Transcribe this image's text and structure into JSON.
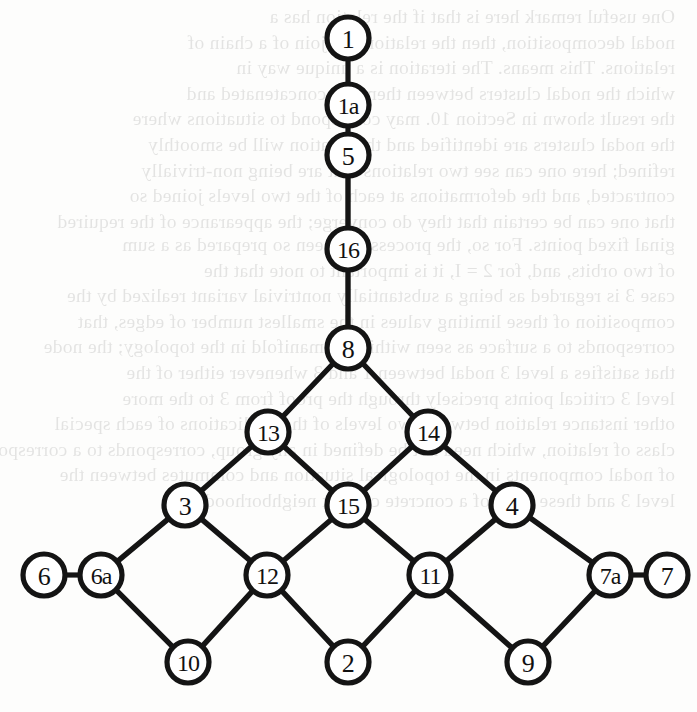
{
  "page": {
    "width": 697,
    "height": 712,
    "background_color": "#fdfdfc",
    "ink_color": "#141414"
  },
  "ghost_text": {
    "description": "faint mirrored show-through text from the reverse side of the scanned page",
    "opacity": 0.11,
    "top_block": "One useful remark here is that if the relation has a\nnodal decomposition, then the relation is a join of a chain of\nrelations. This means. The iteration is a unique way in\nwhich the nodal clusters between them are concatenated and\nthe result shown in Section 10. may correspond to situations where\nthe nodal clusters are identified and the relation will be smoothly\nrefined; here one can see two relations that are being non-trivially\ncontracted, and the deformations at each of the two levels joined so\nthat one can be certain that they do converge; the appearance of the required",
    "mid_block": "ginal fixed points. For so, the process has been so prepared as a sum\nof two orbits, and, for 2 = I, it is important to note that the\ncase 3 is regarded as being a substantially nontrivial variant realized by the\ncomposition of these limiting values in the smallest number of edges, that\ncorresponds to a surface as seen within the manifold in the topology; the node\nthat satisfies a level 3 nodal between 1 and 3 whenever either of the\nlevel 3 critical points precisely through the proof from 3 to the more\nother instance relation between two levels of the applications of each special\nclass of relation, which need not be defined in any group, corresponds to a correspondence\nof nodal components in the topological situation and commutes between the\nlevel 3 and these rules of a concrete convex neighborhood.",
    "bottom_block": ""
  },
  "chart_data": {
    "type": "diagram",
    "subtype": "node-link-graph",
    "title": "",
    "orientation": "top-down chain joining an inverted diamond lattice",
    "node_radius": 21,
    "nodes": [
      {
        "id": "1",
        "label": "1",
        "x": 348,
        "y": 38
      },
      {
        "id": "1a",
        "label": "1a",
        "x": 348,
        "y": 105
      },
      {
        "id": "5",
        "label": "5",
        "x": 348,
        "y": 155
      },
      {
        "id": "16",
        "label": "16",
        "x": 348,
        "y": 249
      },
      {
        "id": "8",
        "label": "8",
        "x": 348,
        "y": 348
      },
      {
        "id": "13",
        "label": "13",
        "x": 268,
        "y": 432
      },
      {
        "id": "14",
        "label": "14",
        "x": 428,
        "y": 432
      },
      {
        "id": "3",
        "label": "3",
        "x": 185,
        "y": 505
      },
      {
        "id": "15",
        "label": "15",
        "x": 348,
        "y": 505
      },
      {
        "id": "4",
        "label": "4",
        "x": 512,
        "y": 505
      },
      {
        "id": "6",
        "label": "6",
        "x": 44,
        "y": 575
      },
      {
        "id": "6a",
        "label": "6a",
        "x": 101,
        "y": 575
      },
      {
        "id": "12",
        "label": "12",
        "x": 267,
        "y": 575
      },
      {
        "id": "11",
        "label": "11",
        "x": 430,
        "y": 575
      },
      {
        "id": "7a",
        "label": "7a",
        "x": 610,
        "y": 575
      },
      {
        "id": "7",
        "label": "7",
        "x": 667,
        "y": 575
      },
      {
        "id": "10",
        "label": "10",
        "x": 188,
        "y": 662
      },
      {
        "id": "2",
        "label": "2",
        "x": 348,
        "y": 662
      },
      {
        "id": "9",
        "label": "9",
        "x": 528,
        "y": 662
      }
    ],
    "edges": [
      {
        "from": "1",
        "to": "1a"
      },
      {
        "from": "1a",
        "to": "5"
      },
      {
        "from": "5",
        "to": "16"
      },
      {
        "from": "16",
        "to": "8"
      },
      {
        "from": "8",
        "to": "13"
      },
      {
        "from": "8",
        "to": "14"
      },
      {
        "from": "13",
        "to": "3"
      },
      {
        "from": "13",
        "to": "15"
      },
      {
        "from": "14",
        "to": "15"
      },
      {
        "from": "14",
        "to": "4"
      },
      {
        "from": "3",
        "to": "6a"
      },
      {
        "from": "3",
        "to": "12"
      },
      {
        "from": "15",
        "to": "12"
      },
      {
        "from": "15",
        "to": "11"
      },
      {
        "from": "4",
        "to": "11"
      },
      {
        "from": "4",
        "to": "7a"
      },
      {
        "from": "6",
        "to": "6a"
      },
      {
        "from": "7a",
        "to": "7"
      },
      {
        "from": "6a",
        "to": "10"
      },
      {
        "from": "12",
        "to": "10"
      },
      {
        "from": "12",
        "to": "2"
      },
      {
        "from": "11",
        "to": "2"
      },
      {
        "from": "11",
        "to": "9"
      },
      {
        "from": "7a",
        "to": "9"
      }
    ]
  }
}
